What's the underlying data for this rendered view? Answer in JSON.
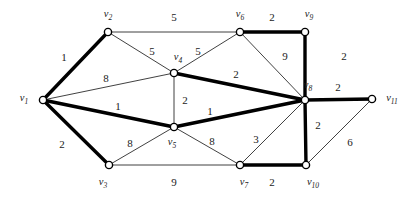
{
  "figure": {
    "kind": "weighted-undirected-graph",
    "width": 416,
    "height": 199,
    "background_color": "#ffffff",
    "edge_color_thin": "#2b2b2b",
    "edge_color_bold": "#000000",
    "node_fill_color": "#ffffff",
    "node_stroke_color": "#000000"
  },
  "chart_data": {
    "type": "diagram",
    "title": "",
    "xlabel": "",
    "ylabel": "",
    "nodes": [
      {
        "id": "v1",
        "label": "v",
        "sub": "1",
        "x": 43,
        "y": 100,
        "label_x": 24,
        "label_y": 99
      },
      {
        "id": "v2",
        "label": "v",
        "sub": "2",
        "x": 108,
        "y": 32,
        "label_x": 108,
        "label_y": 15
      },
      {
        "id": "v3",
        "label": "v",
        "sub": "3",
        "x": 109,
        "y": 165,
        "label_x": 103,
        "label_y": 183
      },
      {
        "id": "v4",
        "label": "v",
        "sub": "4",
        "x": 174,
        "y": 73,
        "label_x": 178,
        "label_y": 58
      },
      {
        "id": "v5",
        "label": "v",
        "sub": "5",
        "x": 174,
        "y": 127,
        "label_x": 172,
        "label_y": 143
      },
      {
        "id": "v6",
        "label": "v",
        "sub": "6",
        "x": 240,
        "y": 32,
        "label_x": 240,
        "label_y": 15
      },
      {
        "id": "v7",
        "label": "v",
        "sub": "7",
        "x": 240,
        "y": 165,
        "label_x": 244,
        "label_y": 183
      },
      {
        "id": "v8",
        "label": "v",
        "sub": "8",
        "x": 305,
        "y": 100,
        "label_x": 308,
        "label_y": 86
      },
      {
        "id": "v9",
        "label": "v",
        "sub": "9",
        "x": 305,
        "y": 32,
        "label_x": 309,
        "label_y": 15
      },
      {
        "id": "v10",
        "label": "v",
        "sub": "10",
        "x": 306,
        "y": 165,
        "label_x": 313,
        "label_y": 183
      },
      {
        "id": "v11",
        "label": "v",
        "sub": "11",
        "x": 372,
        "y": 99,
        "label_x": 392,
        "label_y": 99
      }
    ],
    "edges": [
      {
        "from": "v1",
        "to": "v2",
        "weight": "1",
        "bold": true,
        "label_x": 64,
        "label_y": 57
      },
      {
        "from": "v1",
        "to": "v4",
        "weight": "8",
        "bold": false,
        "label_x": 106,
        "label_y": 78
      },
      {
        "from": "v1",
        "to": "v5",
        "weight": "1",
        "bold": true,
        "label_x": 118,
        "label_y": 106
      },
      {
        "from": "v1",
        "to": "v3",
        "weight": "2",
        "bold": true,
        "label_x": 62,
        "label_y": 144
      },
      {
        "from": "v2",
        "to": "v6",
        "weight": "5",
        "bold": false,
        "label_x": 174,
        "label_y": 17
      },
      {
        "from": "v2",
        "to": "v4",
        "weight": "5",
        "bold": false,
        "label_x": 152,
        "label_y": 51
      },
      {
        "from": "v3",
        "to": "v5",
        "weight": "8",
        "bold": false,
        "label_x": 130,
        "label_y": 143
      },
      {
        "from": "v3",
        "to": "v7",
        "weight": "9",
        "bold": false,
        "label_x": 174,
        "label_y": 182
      },
      {
        "from": "v4",
        "to": "v6",
        "weight": "5",
        "bold": false,
        "label_x": 198,
        "label_y": 51
      },
      {
        "from": "v4",
        "to": "v5",
        "weight": "2",
        "bold": false,
        "label_x": 185,
        "label_y": 100
      },
      {
        "from": "v4",
        "to": "v8",
        "weight": "2",
        "bold": true,
        "label_x": 236,
        "label_y": 74
      },
      {
        "from": "v5",
        "to": "v8",
        "weight": "1",
        "bold": true,
        "label_x": 210,
        "label_y": 111
      },
      {
        "from": "v5",
        "to": "v7",
        "weight": "8",
        "bold": false,
        "label_x": 212,
        "label_y": 141
      },
      {
        "from": "v6",
        "to": "v9",
        "weight": "2",
        "bold": true,
        "label_x": 272,
        "label_y": 17
      },
      {
        "from": "v6",
        "to": "v8",
        "weight": "9",
        "bold": false,
        "label_x": 285,
        "label_y": 56
      },
      {
        "from": "v7",
        "to": "v8",
        "weight": "3",
        "bold": false,
        "label_x": 256,
        "label_y": 139
      },
      {
        "from": "v7",
        "to": "v10",
        "weight": "2",
        "bold": true,
        "label_x": 272,
        "label_y": 182
      },
      {
        "from": "v8",
        "to": "v9",
        "weight": "2",
        "bold": true,
        "label_x": 344,
        "label_y": 56
      },
      {
        "from": "v8",
        "to": "v11",
        "weight": "2",
        "bold": true,
        "label_x": 338,
        "label_y": 87
      },
      {
        "from": "v8",
        "to": "v10",
        "weight": "2",
        "bold": true,
        "label_x": 318,
        "label_y": 125
      },
      {
        "from": "v10",
        "to": "v11",
        "weight": "6",
        "bold": false,
        "label_x": 350,
        "label_y": 142
      }
    ]
  }
}
